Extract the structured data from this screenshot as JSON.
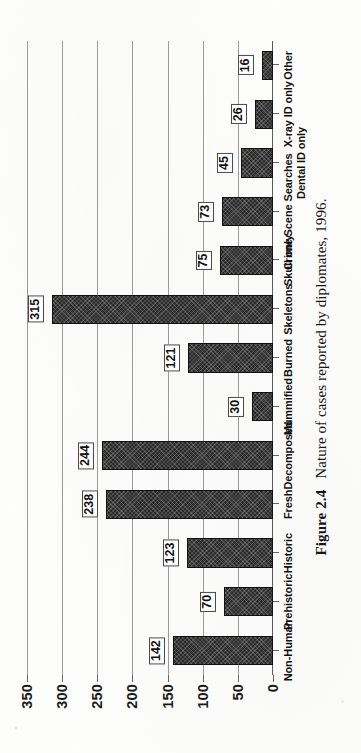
{
  "caption": {
    "number": "Figure 2.4",
    "text": "Nature of cases reported by diplomates, 1996."
  },
  "chart_data": {
    "type": "bar",
    "orientation": "horizontal-on-page",
    "title": "",
    "xlabel": "",
    "ylabel": "",
    "ylim": [
      0,
      350
    ],
    "grid": true,
    "legend": "none",
    "categories": [
      "Non-Human",
      "Prehistoric",
      "Historic",
      "Fresh",
      "Decomposed",
      "Mummified",
      "Burned",
      "Skeletons",
      "Skull only",
      "Crime Scene Searches",
      "Dental ID only",
      "X-ray ID only",
      "Other"
    ],
    "values": [
      142,
      70,
      123,
      238,
      244,
      30,
      121,
      315,
      75,
      73,
      45,
      26,
      16
    ],
    "tick_labels": [
      "0",
      "50",
      "100",
      "150",
      "200",
      "250",
      "300",
      "350"
    ],
    "tick_values": [
      0,
      50,
      100,
      150,
      200,
      250,
      300,
      350
    ],
    "bar_color": "#2b2b2b",
    "gridline_color": "#9a9a9a"
  }
}
